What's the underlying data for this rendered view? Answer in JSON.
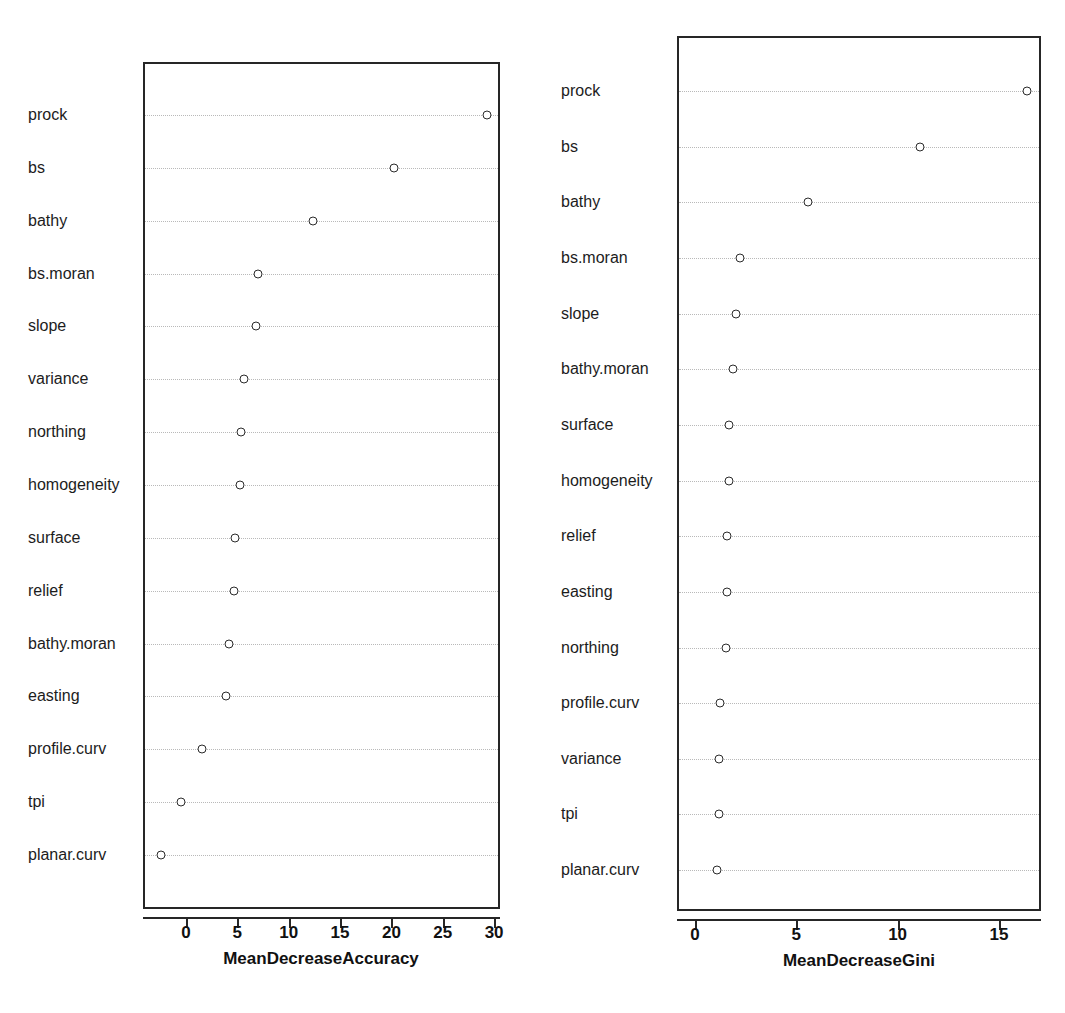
{
  "figure": {
    "kind": "variable-importance-dotplot-pair",
    "background_color": "#ffffff",
    "marker_color": "#2b2b2b",
    "axis_color": "#262626",
    "grid_color": "#b9b9b9"
  },
  "chart_data": [
    {
      "type": "scatter",
      "panel": "left",
      "title": "",
      "xlabel": "MeanDecreaseAccuracy",
      "ylabel": "",
      "xlim": [
        -3.2,
        31.0
      ],
      "xticks": [
        0,
        5,
        10,
        15,
        20,
        25,
        30
      ],
      "xtick_labels": [
        "0",
        "5",
        "10",
        "15",
        "20",
        "25",
        "30"
      ],
      "grid": "horizontal-dotted",
      "legend": "none",
      "categories": [
        "prock",
        "bs",
        "bathy",
        "bs.moran",
        "slope",
        "variance",
        "northing",
        "homogeneity",
        "surface",
        "relief",
        "bathy.moran",
        "easting",
        "profile.curv",
        "tpi",
        "planar.curv"
      ],
      "values": [
        29.3,
        20.3,
        12.4,
        7.0,
        6.8,
        5.6,
        5.4,
        5.3,
        4.8,
        4.7,
        4.2,
        3.9,
        1.6,
        -0.5,
        -2.4
      ]
    },
    {
      "type": "scatter",
      "panel": "right",
      "title": "",
      "xlabel": "MeanDecreaseGini",
      "ylabel": "",
      "xlim": [
        0.6,
        17.2
      ],
      "xticks": [
        0,
        5,
        10,
        15
      ],
      "xtick_labels": [
        "0",
        "5",
        "10",
        "15"
      ],
      "grid": "horizontal-dotted",
      "legend": "none",
      "categories": [
        "prock",
        "bs",
        "bathy",
        "bs.moran",
        "slope",
        "bathy.moran",
        "surface",
        "homogeneity",
        "relief",
        "easting",
        "northing",
        "profile.curv",
        "variance",
        "tpi",
        "planar.curv"
      ],
      "values": [
        16.4,
        11.1,
        5.6,
        2.2,
        2.0,
        1.9,
        1.7,
        1.68,
        1.58,
        1.56,
        1.53,
        1.22,
        1.18,
        1.17,
        1.1
      ]
    }
  ]
}
